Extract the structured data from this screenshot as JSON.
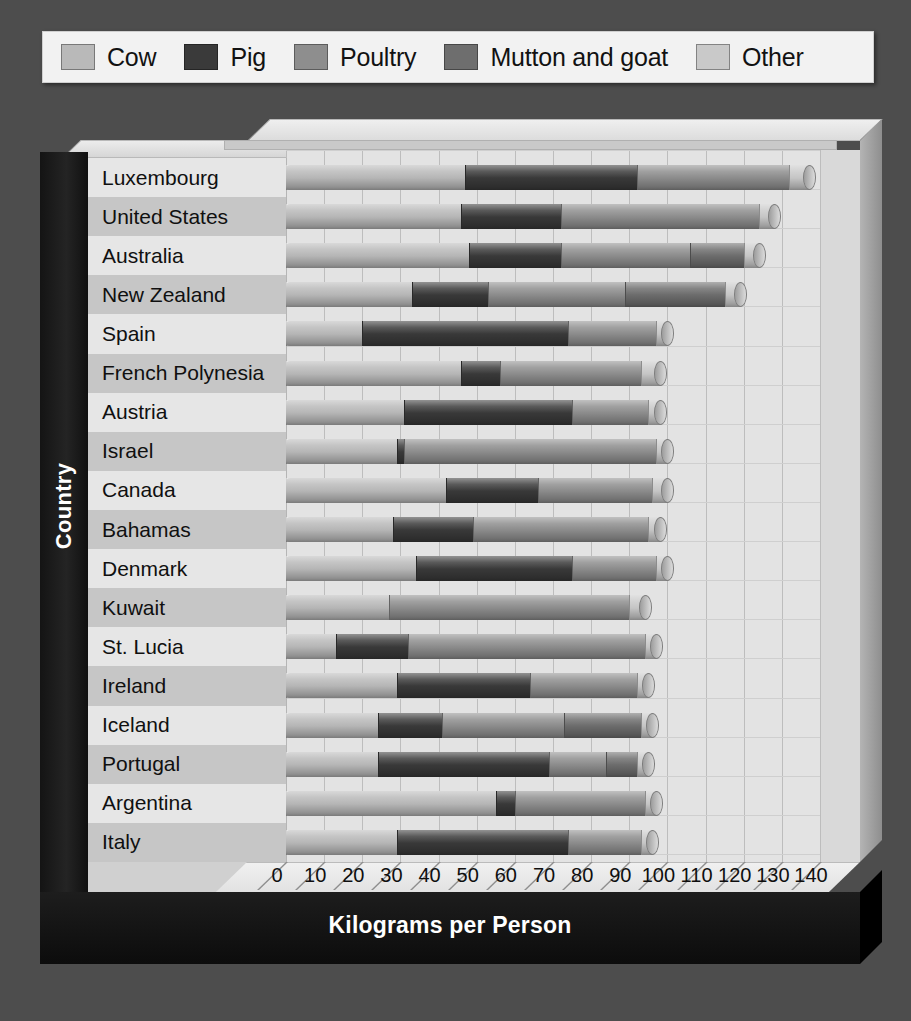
{
  "legend": {
    "items": [
      {
        "label": "Cow",
        "color": "#b9b9b9",
        "icon": "legend-swatch"
      },
      {
        "label": "Pig",
        "color": "#3a3a3a",
        "icon": "legend-swatch"
      },
      {
        "label": "Poultry",
        "color": "#8e8e8e",
        "icon": "legend-swatch"
      },
      {
        "label": "Mutton and goat",
        "color": "#6e6e6e",
        "icon": "legend-swatch"
      },
      {
        "label": "Other",
        "color": "#c9c9c9",
        "icon": "legend-swatch"
      }
    ]
  },
  "axes": {
    "x_title": "Kilograms per Person",
    "y_title": "Country"
  },
  "chart_data": {
    "type": "bar",
    "subtype": "stacked-horizontal-3d-cylinder",
    "title": "",
    "xlabel": "Kilograms per Person",
    "ylabel": "Country",
    "xlim": [
      0,
      140
    ],
    "xticks": [
      0,
      10,
      20,
      30,
      40,
      50,
      60,
      70,
      80,
      90,
      100,
      110,
      120,
      130,
      140
    ],
    "grid": true,
    "legend_position": "top",
    "categories": [
      "Luxembourg",
      "United States",
      "Australia",
      "New Zealand",
      "Spain",
      "French Polynesia",
      "Austria",
      "Israel",
      "Canada",
      "Bahamas",
      "Denmark",
      "Kuwait",
      "St. Lucia",
      "Ireland",
      "Iceland",
      "Portugal",
      "Argentina",
      "Italy"
    ],
    "series": [
      {
        "name": "Cow",
        "color": "#b9b9b9",
        "values": [
          47,
          46,
          48,
          33,
          20,
          46,
          31,
          29,
          42,
          28,
          34,
          27,
          13,
          29,
          24,
          24,
          55,
          29
        ]
      },
      {
        "name": "Pig",
        "color": "#3a3a3a",
        "values": [
          45,
          26,
          24,
          20,
          54,
          10,
          44,
          2,
          24,
          21,
          41,
          0,
          19,
          35,
          17,
          45,
          5,
          45
        ]
      },
      {
        "name": "Poultry",
        "color": "#8e8e8e",
        "values": [
          40,
          52,
          34,
          36,
          23,
          37,
          20,
          66,
          30,
          46,
          22,
          63,
          62,
          28,
          32,
          15,
          34,
          19
        ]
      },
      {
        "name": "Mutton and goat",
        "color": "#6e6e6e",
        "values": [
          0,
          0,
          14,
          26,
          0,
          0,
          0,
          0,
          0,
          0,
          0,
          0,
          0,
          0,
          20,
          8,
          0,
          0
        ]
      },
      {
        "name": "Other",
        "color": "#c9c9c9",
        "values": [
          5,
          4,
          4,
          4,
          3,
          5,
          3,
          3,
          4,
          3,
          3,
          4,
          3,
          3,
          3,
          3,
          3,
          3
        ]
      }
    ],
    "totals": [
      137,
      128,
      124,
      119,
      100,
      98,
      98,
      100,
      100,
      98,
      100,
      94,
      97,
      95,
      96,
      95,
      97,
      96
    ]
  }
}
